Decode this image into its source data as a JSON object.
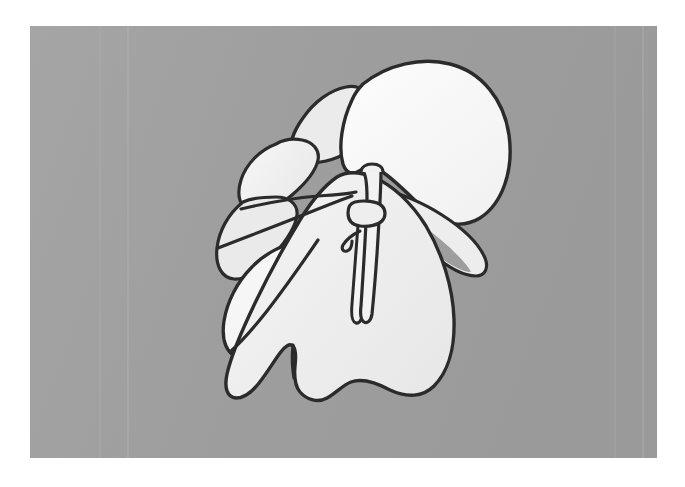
{
  "figure": {
    "kind": "line-drawing-illustration",
    "subject": "plant-bud-with-petals-and-stem",
    "background_color": "#a0a0a0",
    "page_color": "#ffffff",
    "ink_color": "#2b2b2b",
    "fill_bright": "#f7f7f7",
    "fill_mid": "#ececec",
    "fill_shade": "#dedede",
    "shadow_color": "#8c8c8c",
    "panel": {
      "x": 30,
      "y": 26,
      "width": 627,
      "height": 432
    },
    "scan_lines": [
      {
        "x": 70,
        "opacity": 0.1
      },
      {
        "x": 98,
        "opacity": 0.16
      },
      {
        "x": 585,
        "opacity": 0.1
      },
      {
        "x": 613,
        "opacity": 0.14
      }
    ],
    "parts": [
      {
        "name": "top-right-petal",
        "fill": "#f8f8f8"
      },
      {
        "name": "upper-back-petal",
        "fill": "#ebebeb"
      },
      {
        "name": "right-lower-petal",
        "fill": "#ededed"
      },
      {
        "name": "left-upper-petal",
        "fill": "#ededed"
      },
      {
        "name": "left-mid-petal",
        "fill": "#eaeaea"
      },
      {
        "name": "left-lower-petal",
        "fill": "#f6f6f6"
      },
      {
        "name": "main-body-lobe",
        "fill": "#eeeeee"
      },
      {
        "name": "stem",
        "fill": "#f2f2f2"
      },
      {
        "name": "stem-collar-ring",
        "fill": "#eeeeee"
      },
      {
        "name": "stem-hook",
        "fill": "none"
      },
      {
        "name": "midrib-groove",
        "fill": "#f4f4f4"
      }
    ]
  }
}
